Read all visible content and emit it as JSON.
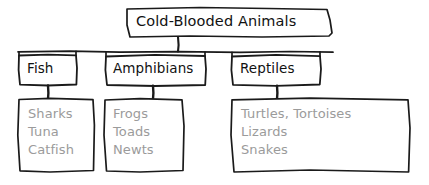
{
  "diagram": {
    "type": "hierarchy-tree",
    "style": "hand-drawn-sketch",
    "root": {
      "label": "Cold-Blooded Animals",
      "text_color": "#111111"
    },
    "branches": [
      {
        "category": "Fish",
        "examples": [
          "Sharks",
          "Tuna",
          "Catfish"
        ]
      },
      {
        "category": "Amphibians",
        "examples": [
          "Frogs",
          "Toads",
          "Newts"
        ]
      },
      {
        "category": "Reptiles",
        "examples": [
          "Turtles, Tortoises",
          "Lizards",
          "Snakes"
        ]
      }
    ],
    "colors": {
      "stroke": "#1a1a1a",
      "category_text": "#111111",
      "example_text": "#9b9b9b",
      "background": "#ffffff"
    }
  }
}
